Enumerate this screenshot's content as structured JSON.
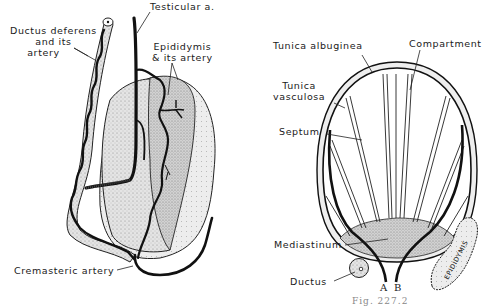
{
  "figure": {
    "left_panel": {
      "labels": {
        "ductus_deferens": [
          "Ductus deferens",
          "and its",
          "artery"
        ],
        "testicular_artery": "Testicular a.",
        "epididymis": [
          "Epididymis",
          "& its artery"
        ],
        "cremasteric_artery": "Cremasteric artery"
      }
    },
    "right_panel": {
      "labels": {
        "tunica_albuginea": "Tunica albuginea",
        "compartment": "Compartment",
        "tunica_vasculosa": [
          "Tunica",
          "vasculosa"
        ],
        "septum": "Septum",
        "mediastinum": "Mediastinum",
        "ductus": "Ductus",
        "artery_a": "A",
        "artery_b": "B",
        "epididymis_inset": "EPIDIDYMIS"
      }
    },
    "caption": "Fig. 227.2",
    "colors": {
      "ink": "#111111",
      "stipple": "#d6d6d6",
      "background": "#ffffff"
    }
  }
}
